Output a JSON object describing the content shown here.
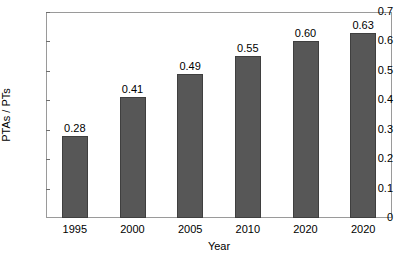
{
  "chart_data": {
    "type": "bar",
    "title": "",
    "xlabel": "Year",
    "ylabel": "PTAs / PTs",
    "categories": [
      "1995",
      "2000",
      "2005",
      "2010",
      "2020",
      "2020"
    ],
    "values": [
      0.28,
      0.41,
      0.49,
      0.55,
      0.6,
      0.63
    ],
    "value_labels": [
      "0.28",
      "0.41",
      "0.49",
      "0.55",
      "0.60",
      "0.63"
    ],
    "ylim": [
      0,
      0.7
    ],
    "ytick_labels": [
      "0.7",
      "0.6",
      "0.5",
      "0.4",
      "0.3",
      "0.2",
      "0.1",
      "0"
    ],
    "ytick_values": [
      0.7,
      0.6,
      0.5,
      0.4,
      0.3,
      0.2,
      0.1,
      0
    ],
    "grid": false,
    "legend": false,
    "bar_color": "#575757",
    "bar_edge_color": "#3f3f3f",
    "axis_color": "#9a9a9a",
    "text_color": "#000000"
  }
}
